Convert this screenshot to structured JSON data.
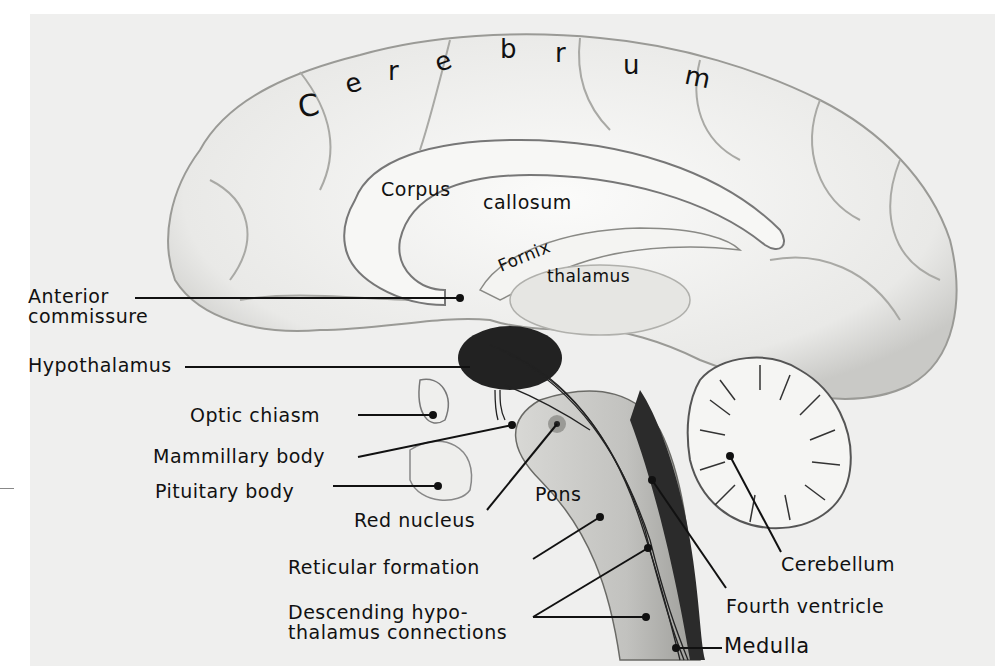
{
  "figure": {
    "title_letters": [
      "C",
      "e",
      "r",
      "e",
      "b",
      "r",
      "u",
      "m"
    ],
    "inner_labels": {
      "corpus": "Corpus",
      "callosum": "callosum",
      "fornix": "Fornix",
      "thalamus": "thalamus",
      "pons": "Pons"
    },
    "left_labels": [
      {
        "id": "anterior-commissure",
        "lines": [
          "Anterior",
          "commissure"
        ]
      },
      {
        "id": "hypothalamus",
        "lines": [
          "Hypothalamus"
        ]
      },
      {
        "id": "optic-chiasm",
        "lines": [
          "Optic chiasm"
        ]
      },
      {
        "id": "mammillary-body",
        "lines": [
          "Mammillary body"
        ]
      },
      {
        "id": "pituitary-body",
        "lines": [
          "Pituitary body"
        ]
      },
      {
        "id": "red-nucleus",
        "lines": [
          "Red nucleus"
        ]
      },
      {
        "id": "reticular-formation",
        "lines": [
          "Reticular formation"
        ]
      },
      {
        "id": "descending-connections",
        "lines": [
          "Descending hypo-",
          "thalamus connections"
        ]
      }
    ],
    "right_labels": [
      {
        "id": "cerebellum",
        "lines": [
          "Cerebellum"
        ]
      },
      {
        "id": "fourth-ventricle",
        "lines": [
          "Fourth ventricle"
        ]
      },
      {
        "id": "medulla",
        "lines": [
          "Medulla"
        ]
      }
    ],
    "colors": {
      "paper": "#efefee",
      "tissue": "#f6f6f4",
      "shade": "#8a8a8a",
      "dark": "#1e1e1e",
      "ink": "#111111"
    }
  }
}
